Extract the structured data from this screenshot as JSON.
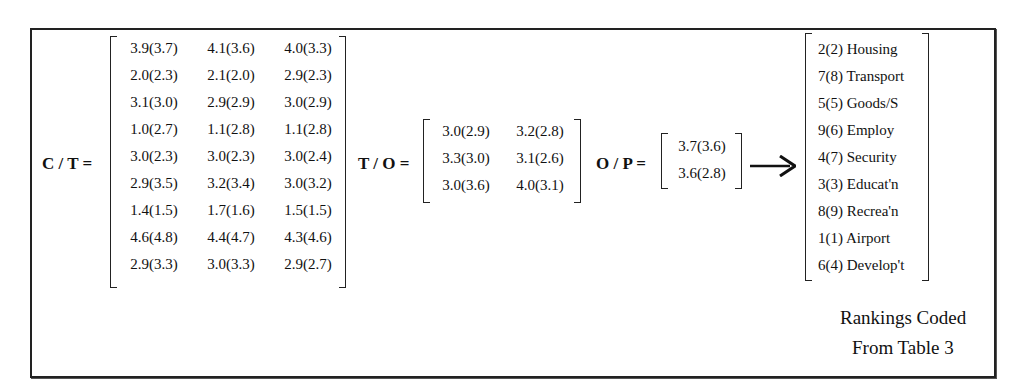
{
  "figure": {
    "ct": {
      "label": "C / T =",
      "rows": [
        [
          "3.9(3.7)",
          "4.1(3.6)",
          "4.0(3.3)"
        ],
        [
          "2.0(2.3)",
          "2.1(2.0)",
          "2.9(2.3)"
        ],
        [
          "3.1(3.0)",
          "2.9(2.9)",
          "3.0(2.9)"
        ],
        [
          "1.0(2.7)",
          "1.1(2.8)",
          "1.1(2.8)"
        ],
        [
          "3.0(2.3)",
          "3.0(2.3)",
          "3.0(2.4)"
        ],
        [
          "2.9(3.5)",
          "3.2(3.4)",
          "3.0(3.2)"
        ],
        [
          "1.4(1.5)",
          "1.7(1.6)",
          "1.5(1.5)"
        ],
        [
          "4.6(4.8)",
          "4.4(4.7)",
          "4.3(4.6)"
        ],
        [
          "2.9(3.3)",
          "3.0(3.3)",
          "2.9(2.7)"
        ]
      ]
    },
    "to": {
      "label": "T / O =",
      "rows": [
        [
          "3.0(2.9)",
          "3.2(2.8)"
        ],
        [
          "3.3(3.0)",
          "3.1(2.6)"
        ],
        [
          "3.0(3.6)",
          "4.0(3.1)"
        ]
      ]
    },
    "op": {
      "label": "O / P =",
      "rows": [
        [
          "3.7(3.6)"
        ],
        [
          "3.6(2.8)"
        ]
      ]
    },
    "arrow_icon": "right-arrow-icon",
    "rankings": [
      "2(2) Housing",
      "7(8) Transport",
      "5(5) Goods/S",
      "9(6) Employ",
      "4(7) Security",
      "3(3) Educat'n",
      "8(9) Recrea'n",
      "1(1) Airport",
      "6(4) Develop't"
    ],
    "caption": {
      "line1": "Rankings Coded",
      "line2": "From Table 3"
    }
  }
}
